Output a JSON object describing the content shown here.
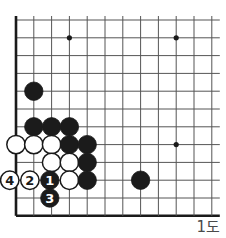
{
  "figure": {
    "label": "1도",
    "kind": "go-board-diagram"
  },
  "board": {
    "origin_x": 16,
    "origin_y": 20,
    "step": 17.8,
    "cols": 12,
    "rows": 11,
    "line_color": "#555555",
    "edge_color": "#1a1a1a",
    "background": "#ffffff",
    "stone_radius": 9.2,
    "star_points": [
      {
        "col": 3,
        "row": 1
      },
      {
        "col": 9,
        "row": 1
      },
      {
        "col": 9,
        "row": 7
      }
    ]
  },
  "colors": {
    "black_stone": "#1b1b1b",
    "white_stone": "#ffffff",
    "stone_outline": "#1a1a1a",
    "label_text": "#4a4a4a"
  },
  "stones": [
    {
      "id": "b-c1r4",
      "color": "black",
      "col": 1,
      "row": 4,
      "number": null
    },
    {
      "id": "b-c1r6",
      "color": "black",
      "col": 1,
      "row": 6,
      "number": null
    },
    {
      "id": "b-c2r6",
      "color": "black",
      "col": 2,
      "row": 6,
      "number": null
    },
    {
      "id": "b-c3r6",
      "color": "black",
      "col": 3,
      "row": 6,
      "number": null
    },
    {
      "id": "w-c0r7",
      "color": "white",
      "col": 0,
      "row": 7,
      "number": null
    },
    {
      "id": "w-c1r7",
      "color": "white",
      "col": 1,
      "row": 7,
      "number": null
    },
    {
      "id": "w-c2r7",
      "color": "white",
      "col": 2,
      "row": 7,
      "number": null
    },
    {
      "id": "b-c3r7",
      "color": "black",
      "col": 3,
      "row": 7,
      "number": null
    },
    {
      "id": "b-c4r7",
      "color": "black",
      "col": 4,
      "row": 7,
      "number": null
    },
    {
      "id": "w-c2r8",
      "color": "white",
      "col": 2,
      "row": 8,
      "number": null
    },
    {
      "id": "w-c3r8",
      "color": "white",
      "col": 3,
      "row": 8,
      "number": null
    },
    {
      "id": "b-c4r8",
      "color": "black",
      "col": 4,
      "row": 8,
      "number": null
    },
    {
      "id": "w-move-4",
      "color": "white",
      "col": -0.35,
      "row": 9,
      "number": "4"
    },
    {
      "id": "w-move-2",
      "color": "white",
      "col": 0.78,
      "row": 9,
      "number": "2"
    },
    {
      "id": "b-move-1",
      "color": "black",
      "col": 1.9,
      "row": 9,
      "number": "1"
    },
    {
      "id": "w-c3r9",
      "color": "white",
      "col": 3,
      "row": 9,
      "number": null
    },
    {
      "id": "b-c4r9",
      "color": "black",
      "col": 4,
      "row": 9,
      "number": null
    },
    {
      "id": "b-c7r9",
      "color": "black",
      "col": 7,
      "row": 9,
      "number": null
    },
    {
      "id": "b-move-3",
      "color": "black",
      "col": 1.9,
      "row": 10,
      "number": "3"
    }
  ]
}
